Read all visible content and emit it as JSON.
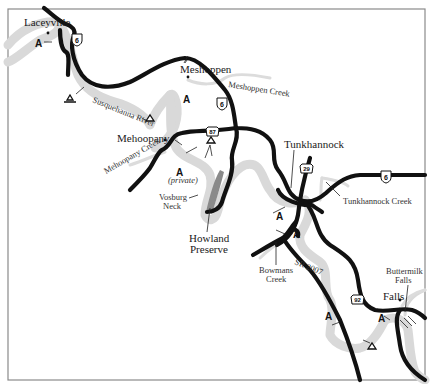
{
  "map": {
    "title": "Susquehanna River: Laceyville to Falls",
    "colors": {
      "road": "#111111",
      "river": "#d9d9d9",
      "preserve": "#8a8a8a",
      "frame": "#8a8a8a",
      "background": "#ffffff"
    },
    "towns": [
      {
        "name": "Laceyville"
      },
      {
        "name": "Meshoppen"
      },
      {
        "name": "Mehoopany"
      },
      {
        "name": "Tunkhannock"
      },
      {
        "name": "Falls"
      }
    ],
    "waterways": [
      {
        "name": "Susquehanna River"
      },
      {
        "name": "Meshoppen Creek"
      },
      {
        "name": "Mehoopany Creek"
      },
      {
        "name": "Tunkhannock Creek"
      },
      {
        "name": "Bowmans Creek"
      }
    ],
    "features": [
      {
        "name": "Vosburg Neck"
      },
      {
        "name": "Howland Preserve"
      },
      {
        "name": "Buttermilk Falls"
      }
    ],
    "roads": [
      {
        "label": "6",
        "type": "us-route"
      },
      {
        "label": "87",
        "type": "pa-route"
      },
      {
        "label": "29",
        "type": "pa-route"
      },
      {
        "label": "92",
        "type": "pa-route"
      },
      {
        "label": "SR 2007",
        "type": "state-road"
      }
    ],
    "symbols": {
      "access": "A",
      "access_note": "(private)",
      "campsite": "campsite-triangle"
    },
    "labels": {
      "laceyville": "Laceyville",
      "meshoppen": "Meshoppen",
      "meshoppen_creek": "Meshoppen Creek",
      "susquehanna": "Susquehanna River",
      "mehoopany": "Mehoopany",
      "mehoopany_creek": "Mehoopany Creek",
      "private": "(private)",
      "vosburg_1": "Vosburg",
      "vosburg_2": "Neck",
      "howland_1": "Howland",
      "howland_2": "Preserve",
      "tunkhannock": "Tunkhannock",
      "tunkhannock_creek": "Tunkhannock Creek",
      "bowmans_1": "Bowmans",
      "bowmans_2": "Creek",
      "sr2007": "SR 2007",
      "buttermilk_1": "Buttermilk",
      "buttermilk_2": "Falls",
      "falls": "Falls",
      "access": "A",
      "us6": "6",
      "pa87": "87",
      "pa29": "29",
      "pa92": "92"
    }
  }
}
